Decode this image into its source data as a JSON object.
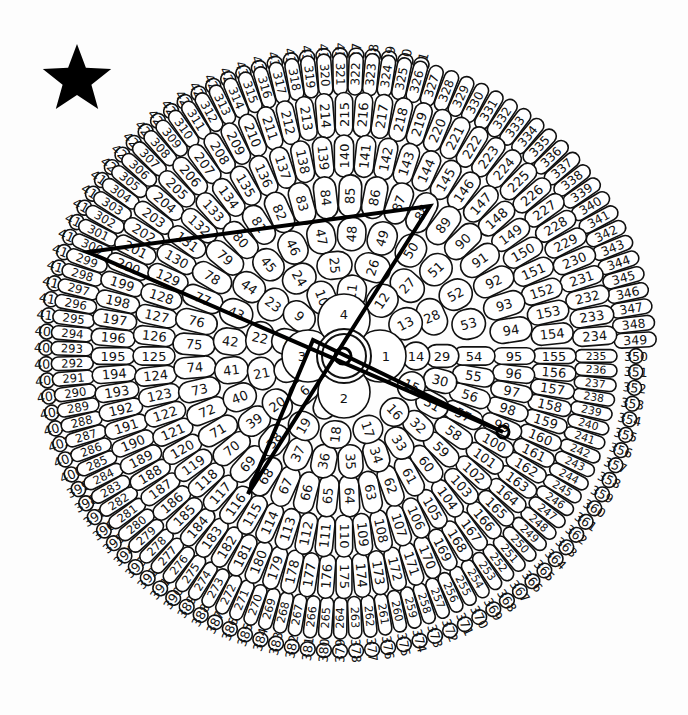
{
  "puzzle": {
    "type": "dot-to-dot spiral",
    "total_numbers": 441,
    "center": [
      344,
      356
    ],
    "anchors_at_right": [
      {
        "n": 1,
        "r": 40
      },
      {
        "n": 14,
        "r": 72
      },
      {
        "n": 29,
        "r": 98
      },
      {
        "n": 54,
        "r": 130
      },
      {
        "n": 95,
        "r": 170
      },
      {
        "n": 155,
        "r": 210
      },
      {
        "n": 235,
        "r": 252
      },
      {
        "n": 350,
        "r": 292
      },
      {
        "n": 465,
        "r": 304
      }
    ],
    "inner_core": {
      "labels": [
        "1",
        "2",
        "3",
        "4"
      ]
    },
    "star_icon": {
      "x": 77,
      "y": 80,
      "size": 36,
      "color": "#000000"
    },
    "drawn_path": {
      "points": [
        {
          "label": "432",
          "x": 88,
          "y": 252
        },
        {
          "label": "86",
          "x": 430,
          "y": 206
        },
        {
          "label": "114",
          "x": 248,
          "y": 494
        },
        {
          "label": "3",
          "x": 313,
          "y": 340
        },
        {
          "label": "160",
          "x": 503,
          "y": 432
        }
      ],
      "closed": true,
      "color": "#000000"
    },
    "markers": [
      {
        "x": 343,
        "y": 356,
        "r": 8
      },
      {
        "x": 503,
        "y": 432,
        "r": 6
      }
    ],
    "center_rings": [
      22,
      27
    ]
  }
}
